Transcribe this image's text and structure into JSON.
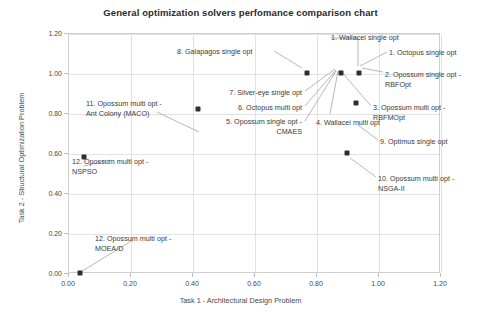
{
  "chart_data": {
    "type": "scatter",
    "title": "General optimization solvers perfomance comparison chart",
    "xlabel": "Task 1 - Architectural Design Problem",
    "ylabel": "Task 2 - Structural Optimization Problem",
    "xlim": [
      0.0,
      1.2
    ],
    "ylim": [
      0.0,
      1.2
    ],
    "xticks": [
      "0.00",
      "0.20",
      "0.40",
      "0.60",
      "0.80",
      "1.00",
      "1.20"
    ],
    "yticks": [
      "0.00",
      "0.20",
      "0.40",
      "0.60",
      "0.80",
      "1.00",
      "1.20"
    ],
    "xtick_values": [
      0.0,
      0.2,
      0.4,
      0.6,
      0.8,
      1.0,
      1.2
    ],
    "ytick_values": [
      0.0,
      0.2,
      0.4,
      0.6,
      0.8,
      1.0,
      1.2
    ],
    "grid": true,
    "legend": "none",
    "marker_color": "#2e2e2e",
    "points": [
      {
        "label": "1. Wallacei single opt",
        "x": 0.88,
        "y": 1.0
      },
      {
        "label": "1. Octopus single opt",
        "x": 0.88,
        "y": 1.0
      },
      {
        "label": "2. Opossum single opt - RBFOpt",
        "x": 0.94,
        "y": 1.0
      },
      {
        "label": "3. Opossum multi opt - RBFMOpt",
        "x": 0.88,
        "y": 1.0
      },
      {
        "label": "4. Wallacei multi opt",
        "x": 0.88,
        "y": 1.0
      },
      {
        "label": "5. Opossum single opt - CMAES",
        "x": 0.88,
        "y": 1.0
      },
      {
        "label": "6. Octopus multi opt",
        "x": 0.88,
        "y": 1.0
      },
      {
        "label": "7. Silver-eye single opt",
        "x": 0.88,
        "y": 1.0
      },
      {
        "label": "8. Galapagos single opt",
        "x": 0.77,
        "y": 1.0
      },
      {
        "label": "9. Optimus single opt",
        "x": 0.93,
        "y": 0.85
      },
      {
        "label": "10. Opossum multi opt - NSGA-II",
        "x": 0.9,
        "y": 0.6
      },
      {
        "label": "11. Opossum multi opt - Ant Colony (MACO)",
        "x": 0.42,
        "y": 0.82
      },
      {
        "label": "12. Opossum multi opt - NSPSO",
        "x": 0.05,
        "y": 0.58
      },
      {
        "label": "12. Opossum multi opt - MOEA/D",
        "x": 0.04,
        "y": 0.0
      }
    ],
    "annotations": [
      {
        "id": "ann-1-wallacei",
        "text": "1. Wallacei single opt"
      },
      {
        "id": "ann-1-octopus",
        "text": "1. Octopus single opt"
      },
      {
        "id": "ann-2-rbfopt",
        "text": "2. Opossum single opt -\nRBFOpt"
      },
      {
        "id": "ann-3-rbfmopt",
        "text": "3. Opossum multi opt -\nRBFMOpt"
      },
      {
        "id": "ann-4-wallacei",
        "text": "4. Wallacei multi opt"
      },
      {
        "id": "ann-5-cmaes",
        "text": "5. Opossum single opt -\nCMAES"
      },
      {
        "id": "ann-6-octopus",
        "text": "6. Octopus multi opt"
      },
      {
        "id": "ann-7-silvereye",
        "text": "7. Silver-eye single opt"
      },
      {
        "id": "ann-8-galapagos",
        "text": "8. Galapagos single opt"
      },
      {
        "id": "ann-9-optimus",
        "text": "9. Optimus single opt"
      },
      {
        "id": "ann-10-nsga",
        "text": "10. Opossum multi opt -\nNSGA-II"
      },
      {
        "id": "ann-11-maco",
        "text": "11. Opossum multi opt -\nAnt Colony (MACO)"
      },
      {
        "id": "ann-12-nspso",
        "text": "12. Opossum multi opt -\nNSPSO"
      },
      {
        "id": "ann-12-moead",
        "text": "12. Opossum multi opt -\nMOEA/D"
      }
    ]
  }
}
